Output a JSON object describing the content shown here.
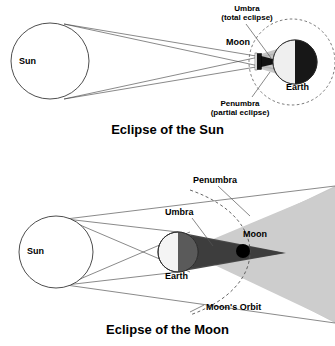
{
  "figure": {
    "title_top": "Eclipse of the Sun",
    "title_bottom": "Eclipse of the Moon"
  },
  "colors": {
    "ink": "#000000",
    "outline": "#333333",
    "umbra_dark": "#1a1a1a",
    "umbra_mid": "#4d4d4d",
    "penumbra_light": "#c8c8c8",
    "penumbra_lighter": "#d8d8d8",
    "earth_light": "#d0d0d0",
    "background": "#ffffff"
  },
  "solar_eclipse": {
    "caption": "Eclipse of the Sun",
    "bodies": {
      "sun": "Sun",
      "moon": "Moon",
      "earth": "Earth"
    },
    "annotations": {
      "umbra_line1": "Umbra",
      "umbra_line2": "(total eclipse)",
      "penumbra_line1": "Penumbra",
      "penumbra_line2": "(partial eclipse)"
    }
  },
  "lunar_eclipse": {
    "caption": "Eclipse of the Moon",
    "bodies": {
      "sun": "Sun",
      "earth": "Earth",
      "moon": "Moon"
    },
    "annotations": {
      "penumbra": "Penumbra",
      "umbra": "Umbra",
      "orbit": "Moon's Orbit"
    }
  }
}
